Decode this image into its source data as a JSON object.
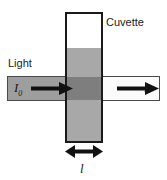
{
  "figure": {
    "name": "cuvette-light-absorption-diagram",
    "labels": {
      "cuvette": "Cuvette",
      "light": "Light",
      "incident_intensity": "I",
      "incident_intensity_subscript": "0",
      "transmitted_intensity": "I",
      "path_length": "l"
    },
    "colors": {
      "outline": "#1a1a1a",
      "beam_outline": "#4a4a4a",
      "beam_incident_fill": "#9e9e9e",
      "beam_transmitted_fill": "#fbfbfb",
      "liquid_fill": "#a8a8a8",
      "overlap_fill": "#7e7e7e",
      "background": "#ffffff",
      "text": "#1a1a1a"
    },
    "icons": {
      "incident_arrow": "arrow-right-icon",
      "transmitted_arrow": "arrow-right-icon",
      "path_length_arrow": "double-headed-arrow-icon"
    }
  }
}
